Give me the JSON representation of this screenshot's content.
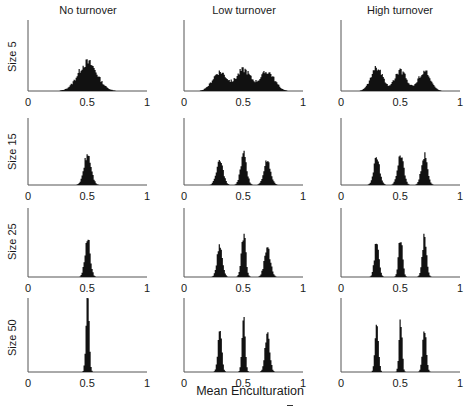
{
  "chart_data": {
    "type": "bar",
    "layout": "grid 4 rows x 3 columns of histograms",
    "xlabel": "Mean Enculturation",
    "ylabel": "",
    "xlim": [
      0,
      1
    ],
    "xticks": [
      "0",
      "0.5",
      "1"
    ],
    "grid": false,
    "legend": null,
    "columns": [
      "No turnover",
      "Low turnover",
      "High turnover"
    ],
    "rows": [
      "Size 5",
      "Size 15",
      "Size 25",
      "Size 50"
    ],
    "panels": [
      {
        "row": "Size 5",
        "col": "No turnover",
        "peaks": [
          {
            "center": 0.5,
            "height": 0.4,
            "width": 0.08
          }
        ]
      },
      {
        "row": "Size 5",
        "col": "Low turnover",
        "peaks": [
          {
            "center": 0.3,
            "height": 0.27,
            "width": 0.06
          },
          {
            "center": 0.5,
            "height": 0.3,
            "width": 0.06
          },
          {
            "center": 0.7,
            "height": 0.27,
            "width": 0.06
          }
        ]
      },
      {
        "row": "Size 5",
        "col": "High turnover",
        "peaks": [
          {
            "center": 0.3,
            "height": 0.32,
            "width": 0.05
          },
          {
            "center": 0.5,
            "height": 0.28,
            "width": 0.05
          },
          {
            "center": 0.7,
            "height": 0.28,
            "width": 0.05
          }
        ]
      },
      {
        "row": "Size 15",
        "col": "No turnover",
        "peaks": [
          {
            "center": 0.5,
            "height": 0.45,
            "width": 0.03
          }
        ]
      },
      {
        "row": "Size 15",
        "col": "Low turnover",
        "peaks": [
          {
            "center": 0.3,
            "height": 0.35,
            "width": 0.028
          },
          {
            "center": 0.5,
            "height": 0.45,
            "width": 0.025
          },
          {
            "center": 0.7,
            "height": 0.37,
            "width": 0.028
          }
        ]
      },
      {
        "row": "Size 15",
        "col": "High turnover",
        "peaks": [
          {
            "center": 0.3,
            "height": 0.4,
            "width": 0.025
          },
          {
            "center": 0.5,
            "height": 0.46,
            "width": 0.025
          },
          {
            "center": 0.7,
            "height": 0.45,
            "width": 0.025
          }
        ]
      },
      {
        "row": "Size 25",
        "col": "No turnover",
        "peaks": [
          {
            "center": 0.5,
            "height": 0.55,
            "width": 0.022
          }
        ]
      },
      {
        "row": "Size 25",
        "col": "Low turnover",
        "peaks": [
          {
            "center": 0.3,
            "height": 0.45,
            "width": 0.022
          },
          {
            "center": 0.5,
            "height": 0.63,
            "width": 0.018
          },
          {
            "center": 0.7,
            "height": 0.42,
            "width": 0.025
          }
        ]
      },
      {
        "row": "Size 25",
        "col": "High turnover",
        "peaks": [
          {
            "center": 0.3,
            "height": 0.55,
            "width": 0.018
          },
          {
            "center": 0.5,
            "height": 0.6,
            "width": 0.016
          },
          {
            "center": 0.7,
            "height": 0.58,
            "width": 0.018
          }
        ]
      },
      {
        "row": "Size 50",
        "col": "No turnover",
        "peaks": [
          {
            "center": 0.5,
            "height": 0.98,
            "width": 0.013
          }
        ]
      },
      {
        "row": "Size 50",
        "col": "Low turnover",
        "peaks": [
          {
            "center": 0.3,
            "height": 0.55,
            "width": 0.016
          },
          {
            "center": 0.5,
            "height": 0.72,
            "width": 0.013
          },
          {
            "center": 0.7,
            "height": 0.5,
            "width": 0.02
          }
        ]
      },
      {
        "row": "Size 50",
        "col": "High turnover",
        "peaks": [
          {
            "center": 0.3,
            "height": 0.65,
            "width": 0.014
          },
          {
            "center": 0.5,
            "height": 0.76,
            "width": 0.012
          },
          {
            "center": 0.7,
            "height": 0.6,
            "width": 0.015
          }
        ]
      }
    ]
  },
  "labels": {
    "col0": "No turnover",
    "col1": "Low turnover",
    "col2": "High turnover",
    "row0": "Size 5",
    "row1": "Size 15",
    "row2": "Size 25",
    "row3": "Size 50",
    "tick0": "0",
    "tick1": "0.5",
    "tick2": "1",
    "xlabel": "Mean Enculturation"
  },
  "colors": {
    "fill": "#111111",
    "axis": "#555555"
  }
}
